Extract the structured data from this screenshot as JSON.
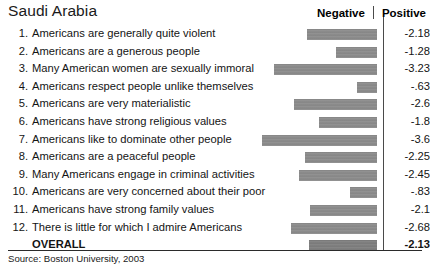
{
  "header": {
    "title": "Saudi Arabia",
    "negative_label": "Negative",
    "positive_label": "Positive",
    "divider_separator": "|"
  },
  "footer": {
    "source": "Source: Boston University, 2003"
  },
  "style": {
    "bar_color": "#8b8b8b",
    "overall_bar_color": "#7e7e7e",
    "divider_color": "#4a4a4a",
    "text_color": "#141414",
    "background": "#ffffff"
  },
  "chart_data": {
    "type": "bar",
    "orientation": "horizontal",
    "title": "Saudi Arabia",
    "xlabel": "",
    "ylabel": "",
    "xlim": [
      -4,
      0
    ],
    "pixels_per_unit": 32,
    "grid": false,
    "legend_position": "top-right",
    "legend": [
      "Negative",
      "Positive"
    ],
    "source": "Source: Boston University, 2003",
    "categories": [
      "Americans are generally quite violent",
      "Americans are a generous people",
      "Many American women are sexually immoral",
      "Americans respect people unlike themselves",
      "Americans are very materialistic",
      "Americans have strong religious values",
      "Americans like to dominate other people",
      "Americans are a peaceful people",
      "Many Americans engage in criminal activities",
      "Americans are very concerned about their poor",
      "Americans have strong family values",
      "There is little for which I admire Americans"
    ],
    "values": [
      -2.18,
      -1.28,
      -3.23,
      -0.63,
      -2.6,
      -1.8,
      -3.6,
      -2.25,
      -2.45,
      -0.83,
      -2.1,
      -2.68
    ],
    "value_labels": [
      "-2.18",
      "-1.28",
      "-3.23",
      "-.63",
      "-2.6",
      "-1.8",
      "-3.6",
      "-2.25",
      "-2.45",
      "-.83",
      "-2.1",
      "-2.68"
    ],
    "overall": {
      "label": "OVERALL",
      "value": -2.13,
      "value_label": "-2.13"
    }
  },
  "rows": [
    {
      "num": "1.",
      "label": "Americans are generally quite violent",
      "value_label": "-2.18",
      "value": -2.18
    },
    {
      "num": "2.",
      "label": "Americans are a generous people",
      "value_label": "-1.28",
      "value": -1.28
    },
    {
      "num": "3.",
      "label": "Many American women are sexually immoral",
      "value_label": "-3.23",
      "value": -3.23
    },
    {
      "num": "4.",
      "label": "Americans respect people unlike themselves",
      "value_label": "-.63",
      "value": -0.63
    },
    {
      "num": "5.",
      "label": "Americans are very materialistic",
      "value_label": "-2.6",
      "value": -2.6
    },
    {
      "num": "6.",
      "label": "Americans have strong religious values",
      "value_label": "-1.8",
      "value": -1.8
    },
    {
      "num": "7.",
      "label": "Americans like to dominate other people",
      "value_label": "-3.6",
      "value": -3.6
    },
    {
      "num": "8.",
      "label": "Americans are a peaceful people",
      "value_label": "-2.25",
      "value": -2.25
    },
    {
      "num": "9.",
      "label": "Many Americans engage in criminal activities",
      "value_label": "-2.45",
      "value": -2.45
    },
    {
      "num": "10.",
      "label": "Americans are very concerned about their poor",
      "value_label": "-.83",
      "value": -0.83
    },
    {
      "num": "11.",
      "label": "Americans have strong family values",
      "value_label": "-2.1",
      "value": -2.1
    },
    {
      "num": "12.",
      "label": "There is little for which I admire Americans",
      "value_label": "-2.68",
      "value": -2.68
    },
    {
      "num": "",
      "label": "OVERALL",
      "value_label": "-2.13",
      "value": -2.13,
      "overall": true
    }
  ]
}
